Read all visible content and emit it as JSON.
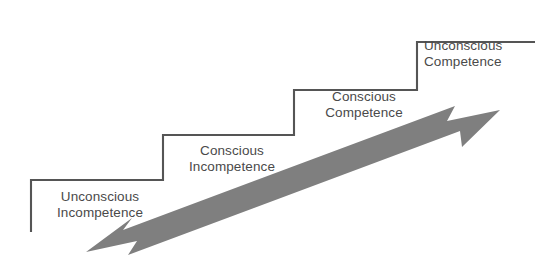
{
  "diagram": {
    "type": "four-stages-of-competence-staircase",
    "background_color": "#ffffff",
    "line_color": "#555555",
    "arrow_color": "#808080",
    "text_color": "#4a4a4a",
    "steps": [
      {
        "index": 1,
        "line1": "Unconscious",
        "line2": "Incompetence"
      },
      {
        "index": 2,
        "line1": "Conscious",
        "line2": "Incompetence"
      },
      {
        "index": 3,
        "line1": "Conscious",
        "line2": "Competence"
      },
      {
        "index": 4,
        "line1": "Unconscious",
        "line2": "Competence"
      }
    ],
    "arrow": {
      "name": "double-headed-progress-arrow",
      "direction": "bidirectional",
      "from": "lower-left",
      "to": "upper-right"
    }
  }
}
